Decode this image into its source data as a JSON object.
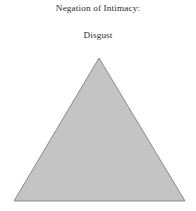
{
  "figure": {
    "width": 196,
    "height": 211,
    "background_color": "#ffffff",
    "title": "Negation of Intimacy:",
    "subtitle": "Disgust",
    "text_color": "#2b2b2b",
    "shape": {
      "name": "triangle",
      "kind": "equilateral-triangle",
      "fill_color": "#c4c4c4",
      "stroke_color": "#8a8a8a",
      "stroke_width": 1,
      "apex_x": 99,
      "apex_y": 58,
      "base_left_x": 14,
      "base_right_x": 185,
      "base_y": 201,
      "points": "99,58 185,201 14,201"
    }
  }
}
